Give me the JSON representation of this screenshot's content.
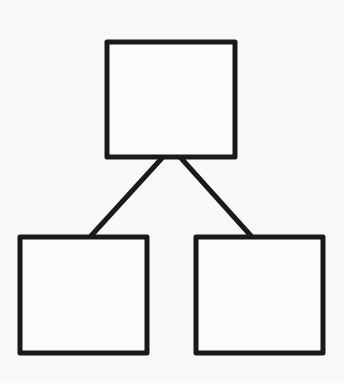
{
  "diagram": {
    "type": "tree",
    "background": "#f9f9f8",
    "stroke_color": "#1a1a1a",
    "stroke_width": 5,
    "nodes": [
      {
        "id": "root",
        "label": "",
        "x": 107,
        "y": 42,
        "width": 128,
        "height": 115
      },
      {
        "id": "left-child",
        "label": "",
        "x": 20,
        "y": 237,
        "width": 127,
        "height": 116
      },
      {
        "id": "right-child",
        "label": "",
        "x": 196,
        "y": 237,
        "width": 127,
        "height": 116
      }
    ],
    "edges": [
      {
        "from": "root",
        "to": "left-child",
        "x1": 163,
        "y1": 157,
        "x2": 90,
        "y2": 237
      },
      {
        "from": "root",
        "to": "right-child",
        "x1": 180,
        "y1": 157,
        "x2": 252,
        "y2": 237
      }
    ]
  }
}
